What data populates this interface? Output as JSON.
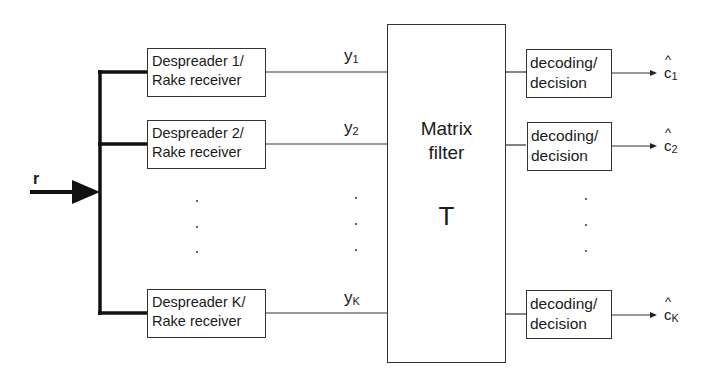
{
  "diagram": {
    "input": {
      "label": "r"
    },
    "despreaders": [
      {
        "line1": "Despreader 1/",
        "line2": "Rake receiver",
        "output": "y",
        "output_sub": "1"
      },
      {
        "line1": "Despreader 2/",
        "line2": "Rake receiver",
        "output": "y",
        "output_sub": "2"
      },
      {
        "line1": "Despreader K/",
        "line2": "Rake receiver",
        "output": "y",
        "output_sub": "K"
      }
    ],
    "matrix": {
      "line1": "Matrix",
      "line2": "filter",
      "symbol": "T"
    },
    "decoders": [
      {
        "line1": "decoding/",
        "line2": "decision",
        "output": "c",
        "output_sub": "1",
        "hat": "^"
      },
      {
        "line1": "decoding/",
        "line2": "decision",
        "output": "c",
        "output_sub": "2",
        "hat": "^"
      },
      {
        "line1": "decoding/",
        "line2": "decision",
        "output": "c",
        "output_sub": "K",
        "hat": "^"
      }
    ],
    "ellipsis": "..."
  }
}
